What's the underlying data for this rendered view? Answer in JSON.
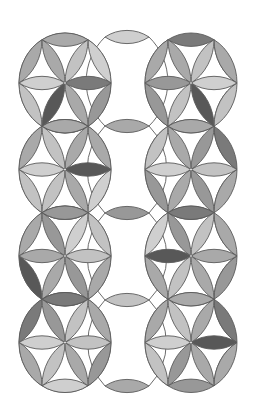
{
  "canvas": {
    "width": 260,
    "height": 409,
    "background": "#ffffff"
  },
  "style": {
    "stroke": "#5a5a5a",
    "stroke_width": 0.9,
    "y_scale": 1.087
  },
  "geometry": {
    "radius": 46,
    "left_column_x": 65,
    "right_column_x": 191,
    "row_y": [
      83,
      169.5,
      256,
      342.5
    ],
    "middle_column_x": 127,
    "middle_petal_y": [
      37,
      126,
      213,
      300,
      386
    ],
    "middle_petal_half_length": 22,
    "hourglass_radius": 62
  },
  "palette": {
    "light": "#cfcfcf",
    "light2": "#c2c2c2",
    "mid": "#a9a9a9",
    "mid2": "#989898",
    "dark": "#7a7a7a",
    "darker": "#585858"
  },
  "flowers": [
    {
      "column": "left",
      "row": 0,
      "outer_circle": true,
      "inner": [
        "dark",
        "light2",
        "mid",
        "light",
        "darker",
        "mid"
      ],
      "outer": [
        "mid",
        "light",
        "mid2",
        "mid2",
        "light2",
        "mid"
      ]
    },
    {
      "column": "left",
      "row": 1,
      "outer_circle": true,
      "inner": [
        "darker",
        "mid",
        "light2",
        "light",
        "light2",
        "mid"
      ],
      "outer": [
        "mid",
        "mid",
        "light",
        "mid2",
        "light2",
        "mid"
      ]
    },
    {
      "column": "left",
      "row": 2,
      "outer_circle": true,
      "inner": [
        "light2",
        "light",
        "mid2",
        "mid",
        "mid",
        "mid2"
      ],
      "outer": [
        "mid2",
        "light2",
        "mid",
        "mid",
        "darker",
        "mid"
      ]
    },
    {
      "column": "left",
      "row": 3,
      "outer_circle": true,
      "inner": [
        "light2",
        "light2",
        "mid2",
        "light",
        "light2",
        "mid"
      ],
      "outer": [
        "dark",
        "mid",
        "mid2",
        "light",
        "mid",
        "dark"
      ]
    },
    {
      "column": "right",
      "row": 0,
      "outer_circle": false,
      "inner": [
        "light",
        "light2",
        "mid",
        "mid2",
        "light2",
        "darker"
      ],
      "outer": [
        "dark",
        "mid",
        "light2",
        "mid",
        "mid2",
        "mid"
      ]
    },
    {
      "column": "right",
      "row": 1,
      "outer_circle": false,
      "inner": [
        "light2",
        "mid2",
        "mid",
        "light",
        "mid",
        "mid2"
      ],
      "outer": [
        "mid",
        "dark",
        "mid",
        "darker",
        "mid2",
        "light2"
      ]
    },
    {
      "column": "right",
      "row": 2,
      "outer_circle": false,
      "inner": [
        "mid",
        "light2",
        "mid2",
        "darker",
        "light2",
        "mid"
      ],
      "outer": [
        "dark",
        "mid",
        "mid2",
        "dark",
        "mid",
        "light"
      ]
    },
    {
      "column": "right",
      "row": 3,
      "outer_circle": false,
      "inner": [
        "darker",
        "mid",
        "light2",
        "light",
        "mid2",
        "mid"
      ],
      "outer": [
        "mid",
        "dark",
        "mid",
        "mid2",
        "light2",
        "mid"
      ]
    }
  ],
  "middle_petals": [
    "light",
    "mid",
    "mid2",
    "light2",
    "mid"
  ]
}
